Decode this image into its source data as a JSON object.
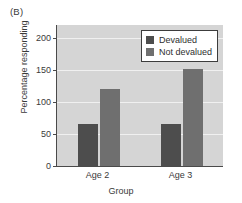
{
  "panel": {
    "label": "(B)"
  },
  "chart_data": {
    "type": "bar",
    "title": "",
    "xlabel": "Group",
    "ylabel": "Percentage responding",
    "categories": [
      "Age 2",
      "Age 3"
    ],
    "series": [
      {
        "name": "Devalued",
        "values": [
          66,
          65
        ],
        "color": "#4d4d4d"
      },
      {
        "name": "Not devalued",
        "values": [
          120,
          152
        ],
        "color": "#6f6f6f"
      }
    ],
    "ylim": [
      0,
      220
    ],
    "yticks": [
      0,
      50,
      100,
      150,
      200
    ],
    "ytick_labels": [
      "0",
      "50",
      "100",
      "150",
      "200"
    ],
    "grid": true,
    "grid_color": "#f0f0f0",
    "plot_background": "#d5d5d5",
    "legend_position": "top-right"
  },
  "legend": {
    "entries": [
      {
        "label": "Devalued"
      },
      {
        "label": "Not devalued"
      }
    ]
  }
}
